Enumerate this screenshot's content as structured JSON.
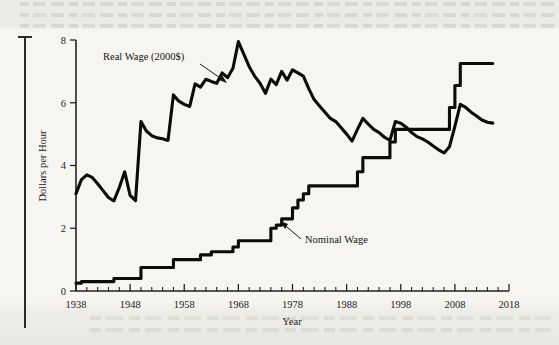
{
  "figure": {
    "axis_titles": {
      "x": "Year",
      "y": "Dollars per Hour"
    },
    "annotations": {
      "real": "Real Wage (2000$)",
      "nominal": "Nominal Wage"
    }
  },
  "chart_data": {
    "type": "line",
    "title": "",
    "xlabel": "Year",
    "ylabel": "Dollars per Hour",
    "xlim": [
      1938,
      2018
    ],
    "ylim": [
      0,
      8
    ],
    "xticks": [
      1938,
      1948,
      1958,
      1968,
      1978,
      1988,
      1998,
      2008,
      2018
    ],
    "xtick_labels": [
      "1938",
      "1948",
      "1958",
      "1968",
      "1978",
      "1988",
      "1998",
      "2008",
      "2018"
    ],
    "xminor_step": 2,
    "yticks": [
      0,
      2,
      4,
      6,
      8
    ],
    "ytick_labels": [
      "0",
      "2",
      "4",
      "6",
      "8"
    ],
    "grid": false,
    "legend": "inline-annotations",
    "line_color": "#0b0b09",
    "series": [
      {
        "name": "Real Wage (2000$)",
        "x": [
          1938,
          1939,
          1940,
          1941,
          1942,
          1943,
          1944,
          1945,
          1946,
          1947,
          1948,
          1949,
          1950,
          1951,
          1952,
          1953,
          1954,
          1955,
          1956,
          1957,
          1958,
          1959,
          1960,
          1961,
          1962,
          1963,
          1964,
          1965,
          1966,
          1967,
          1968,
          1969,
          1970,
          1971,
          1972,
          1973,
          1974,
          1975,
          1976,
          1977,
          1978,
          1979,
          1980,
          1981,
          1982,
          1983,
          1984,
          1985,
          1986,
          1987,
          1988,
          1989,
          1990,
          1991,
          1992,
          1993,
          1994,
          1995,
          1996,
          1997,
          1998,
          1999,
          2000,
          2001,
          2002,
          2003,
          2004,
          2005,
          2006,
          2007,
          2008,
          2009,
          2010,
          2011,
          2012,
          2013,
          2014,
          2015
        ],
        "values": [
          3.1,
          3.55,
          3.7,
          3.62,
          3.42,
          3.2,
          2.98,
          2.87,
          3.3,
          3.8,
          3.05,
          2.88,
          5.4,
          5.1,
          4.95,
          4.88,
          4.85,
          4.8,
          6.25,
          6.05,
          5.95,
          5.88,
          6.6,
          6.5,
          6.75,
          6.68,
          6.62,
          6.95,
          6.8,
          7.1,
          7.95,
          7.55,
          7.15,
          6.85,
          6.62,
          6.3,
          6.75,
          6.58,
          7.0,
          6.72,
          7.05,
          6.95,
          6.85,
          6.45,
          6.1,
          5.9,
          5.7,
          5.5,
          5.4,
          5.2,
          5.0,
          4.78,
          5.15,
          5.5,
          5.32,
          5.15,
          5.05,
          4.9,
          4.8,
          5.4,
          5.35,
          5.22,
          5.05,
          4.92,
          4.85,
          4.75,
          4.62,
          4.5,
          4.4,
          4.6,
          5.25,
          5.95,
          5.85,
          5.7,
          5.58,
          5.45,
          5.38,
          5.35
        ],
        "units": "2000 dollars per hour"
      },
      {
        "name": "Nominal Wage",
        "x": [
          1938,
          1939,
          1940,
          1941,
          1942,
          1943,
          1944,
          1945,
          1946,
          1947,
          1948,
          1949,
          1950,
          1951,
          1952,
          1953,
          1954,
          1955,
          1956,
          1957,
          1958,
          1959,
          1960,
          1961,
          1962,
          1963,
          1964,
          1965,
          1966,
          1967,
          1968,
          1969,
          1970,
          1971,
          1972,
          1973,
          1974,
          1975,
          1976,
          1977,
          1978,
          1979,
          1980,
          1981,
          1982,
          1983,
          1984,
          1985,
          1986,
          1987,
          1988,
          1989,
          1990,
          1991,
          1992,
          1993,
          1994,
          1995,
          1996,
          1997,
          1998,
          1999,
          2000,
          2001,
          2002,
          2003,
          2004,
          2005,
          2006,
          2007,
          2008,
          2009,
          2010,
          2011,
          2012,
          2013,
          2014,
          2015
        ],
        "values": [
          0.25,
          0.3,
          0.3,
          0.3,
          0.3,
          0.3,
          0.3,
          0.4,
          0.4,
          0.4,
          0.4,
          0.4,
          0.75,
          0.75,
          0.75,
          0.75,
          0.75,
          0.75,
          1.0,
          1.0,
          1.0,
          1.0,
          1.0,
          1.15,
          1.15,
          1.25,
          1.25,
          1.25,
          1.25,
          1.4,
          1.6,
          1.6,
          1.6,
          1.6,
          1.6,
          1.6,
          2.0,
          2.1,
          2.3,
          2.3,
          2.65,
          2.9,
          3.1,
          3.35,
          3.35,
          3.35,
          3.35,
          3.35,
          3.35,
          3.35,
          3.35,
          3.35,
          3.8,
          4.25,
          4.25,
          4.25,
          4.25,
          4.25,
          4.75,
          5.15,
          5.15,
          5.15,
          5.15,
          5.15,
          5.15,
          5.15,
          5.15,
          5.15,
          5.15,
          5.85,
          6.55,
          7.25,
          7.25,
          7.25,
          7.25,
          7.25,
          7.25,
          7.25
        ],
        "units": "current dollars per hour"
      }
    ]
  }
}
